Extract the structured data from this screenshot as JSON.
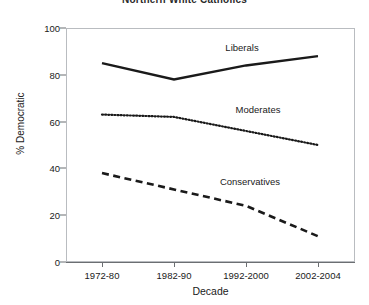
{
  "chart_data": {
    "type": "line",
    "title": "Northern White Catholics",
    "xlabel": "Decade",
    "ylabel": "% Democratic",
    "categories": [
      "1972-80",
      "1982-90",
      "1992-2000",
      "2002-2004"
    ],
    "yticks": [
      "0",
      "20",
      "40",
      "60",
      "80",
      "100"
    ],
    "ylim": [
      0,
      100
    ],
    "grid": false,
    "legend": "inline-labels",
    "series": [
      {
        "name": "Liberals",
        "values": [
          85,
          78,
          84,
          88
        ],
        "style": "solid"
      },
      {
        "name": "Moderates",
        "values": [
          63,
          62,
          56,
          50
        ],
        "style": "dotted"
      },
      {
        "name": "Conservatives",
        "values": [
          38,
          31,
          24,
          11
        ],
        "style": "dashed"
      }
    ],
    "colors": {
      "line": "#1a1a1a",
      "frame": "#b9bcc0",
      "background": "#ffffff"
    }
  }
}
